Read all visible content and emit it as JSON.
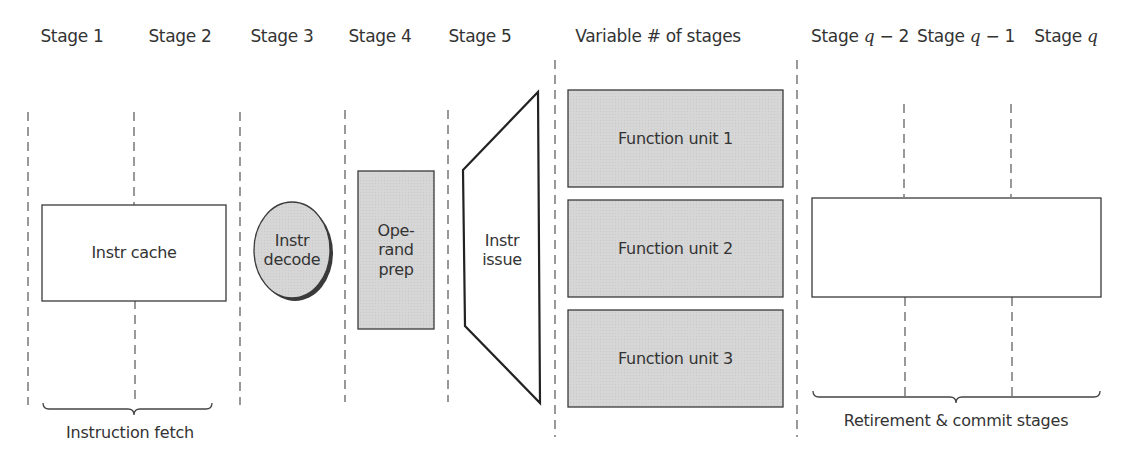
{
  "header": {
    "stages": [
      {
        "label": "Stage 1",
        "x": 72
      },
      {
        "label": "Stage 2",
        "x": 180
      },
      {
        "label": "Stage 3",
        "x": 282
      },
      {
        "label": "Stage 4",
        "x": 380
      },
      {
        "label": "Stage 5",
        "x": 480
      },
      {
        "label": "Variable # of stages",
        "x": 658
      },
      {
        "label": "Stage q − 2",
        "x": 860
      },
      {
        "label": "Stage q − 1",
        "x": 964
      },
      {
        "label": "Stage q",
        "x": 1063
      }
    ],
    "stage_q2_prefix": "Stage ",
    "stage_q2_var": "q",
    "stage_q2_suffix": " − 2",
    "stage_q1_prefix": "Stage ",
    "stage_q1_var": "q",
    "stage_q1_suffix": " − 1",
    "stage_q_prefix": "Stage ",
    "stage_q_var": "q"
  },
  "nodes": {
    "instr_cache": {
      "label": "Instr cache",
      "fill": "#ffffff"
    },
    "instr_decode": {
      "line1": "Instr",
      "line2": "decode",
      "fill": "#d4d4d4"
    },
    "operand_prep": {
      "line1": "Ope-",
      "line2": "rand",
      "line3": "prep",
      "fill": "#d4d4d4"
    },
    "instr_issue": {
      "line1": "Instr",
      "line2": "issue",
      "fill": "#ffffff"
    },
    "function_units": [
      {
        "label": "Function unit 1"
      },
      {
        "label": "Function unit 2"
      },
      {
        "label": "Function unit 3"
      }
    ],
    "function_unit_fill": "#d4d4d4",
    "retirement_box": {
      "label": "",
      "fill": "#ffffff"
    }
  },
  "groups": {
    "instruction_fetch": "Instruction fetch",
    "retirement_commit": "Retirement & commit stages"
  },
  "colors": {
    "stroke": "#3a3a3a",
    "dash": "#555555",
    "shaded": "#d4d4d4",
    "text": "#333333"
  }
}
